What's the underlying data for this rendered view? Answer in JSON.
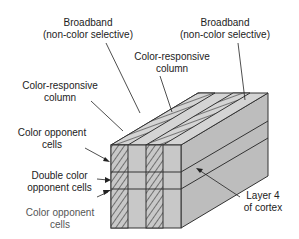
{
  "diagram": {
    "labels": {
      "broadband_left": {
        "line1": "Broadband",
        "line2": "(non-color selective)"
      },
      "broadband_right": {
        "line1": "Broadband",
        "line2": "(non-color selective)"
      },
      "color_responsive_mid": {
        "line1": "Color-responsive",
        "line2": "column"
      },
      "color_responsive_left": {
        "line1": "Color-responsive",
        "line2": "column"
      },
      "color_opponent_top": {
        "line1": "Color opponent",
        "line2": "cells"
      },
      "double_color_opponent": {
        "line1": "Double color",
        "line2": "opponent cells"
      },
      "color_opponent_bottom": {
        "line1": "Color opponent",
        "line2": "cells"
      },
      "layer4": {
        "line1": "Layer 4",
        "line2": "of cortex"
      }
    },
    "colors": {
      "face_fill": "#c8c8c8",
      "top_fill": "#d4d4d4",
      "side_fill": "#bdbdbd",
      "stroke": "#333333"
    }
  }
}
